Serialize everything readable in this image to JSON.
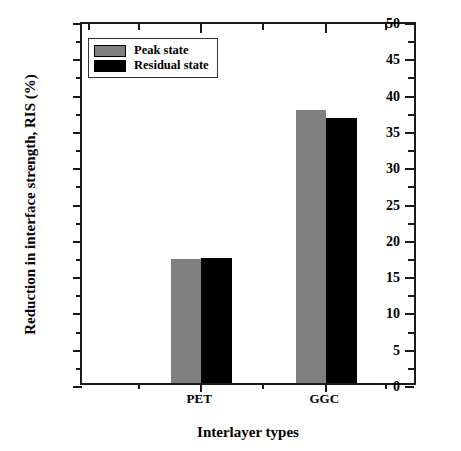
{
  "chart_data": {
    "type": "bar",
    "title": "",
    "xlabel": "Interlayer types",
    "ylabel": "Reduction in interface strength, RIS (%)",
    "categories": [
      "PET",
      "GGC"
    ],
    "series": [
      {
        "name": "Peak state",
        "color": "#808080",
        "values": [
          17.1,
          37.6
        ]
      },
      {
        "name": "Residual state",
        "color": "#000000",
        "values": [
          17.2,
          36.5
        ]
      }
    ],
    "ylim": [
      0,
      50
    ],
    "ytick_labels": [
      "0",
      "5",
      "10",
      "15",
      "20",
      "25",
      "30",
      "35",
      "40",
      "45",
      "50"
    ],
    "ytick_values": [
      0,
      5,
      10,
      15,
      20,
      25,
      30,
      35,
      40,
      45,
      50
    ],
    "yminor_step": 2.5,
    "grid": false,
    "legend_position": "upper-left",
    "frame": true
  },
  "axes": {
    "y_title": "Reduction in interface strength, RIS (%)",
    "x_title": "Interlayer types"
  },
  "legend": {
    "entries": [
      {
        "label": "Peak state",
        "swatch": "peak-state-swatch"
      },
      {
        "label": "Residual state",
        "swatch": "residual-state-swatch"
      }
    ]
  }
}
